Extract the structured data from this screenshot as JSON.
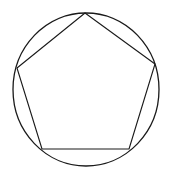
{
  "diagram": {
    "title": "",
    "stroke_color": "#1a1a1a",
    "background": "#ffffff",
    "circle": {
      "cx": 86,
      "cy": 89.5,
      "rx": 73,
      "ry": 76.5
    },
    "pentagon_points": "85,13 155,64 129,149 42,149 17,68"
  }
}
